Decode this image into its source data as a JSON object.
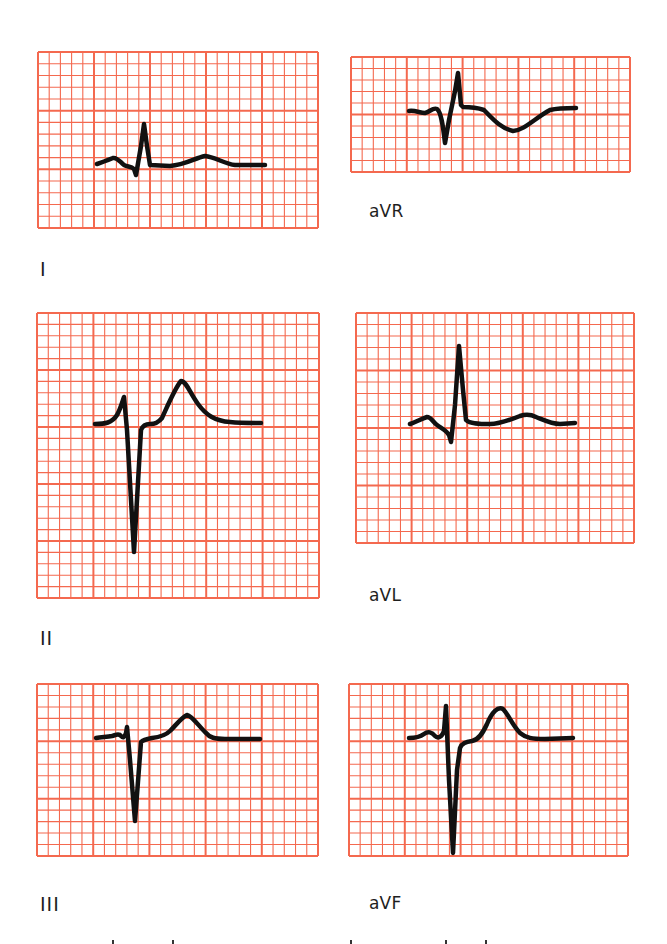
{
  "figure": {
    "grid_color": "#f4694f",
    "trace_color": "#111111",
    "label_color": "#1e1e1e",
    "small_squares_per_large": 5
  },
  "leads": [
    {
      "id": "I",
      "label": "I",
      "panel": {
        "x": 38,
        "y": 52,
        "w": 280,
        "h": 176,
        "cols": 5,
        "rows": 3
      },
      "label_pos": {
        "x": 40,
        "y": 258
      },
      "trace": "M97,164 C103,162 108,160 113,158 C117,157 120,162 124,165 C128,167 131,166 134,169 L136,175 L141,146 L144,124 L147,146 L150,165 L170,166 C185,165 195,158 205,156 C215,157 225,164 235,165 L265,165",
      "thick_from": 0
    },
    {
      "id": "aVR",
      "label": "aVR",
      "panel": {
        "x": 351,
        "y": 57,
        "w": 279,
        "h": 115,
        "cols": 5,
        "rows": 2
      },
      "label_pos": {
        "x": 369,
        "y": 201
      },
      "trace": "M409,111 C415,110 420,113 425,113 C430,112 433,107 437,109 C441,112 443,125 445,143 L449,120 L455,91 L458,73 L461,105 L463,107 C470,107 478,108 484,110 C492,118 500,128 513,131 C525,130 535,118 550,110 C558,108 568,108 576,108",
      "thick_from": 0
    },
    {
      "id": "II",
      "label": "II",
      "panel": {
        "x": 37,
        "y": 313,
        "w": 282,
        "h": 285,
        "cols": 5,
        "rows": 5
      },
      "label_pos": {
        "x": 40,
        "y": 627
      },
      "trace": "M95,424 C105,424 112,423 117,415 C120,410 122,403 124,397 L127,430 L134,552 L141,430 C143,425 146,424 150,424 C155,424 158,423 162,418 C168,405 175,388 181,381 C186,381 190,393 198,404 C206,415 215,421 230,422 C240,423 250,423 261,423",
      "thick_from": 0
    },
    {
      "id": "aVL",
      "label": "aVL",
      "panel": {
        "x": 356,
        "y": 313,
        "w": 278,
        "h": 230,
        "cols": 5,
        "rows": 4
      },
      "label_pos": {
        "x": 369,
        "y": 585
      },
      "trace": "M410,424 C416,422 421,419 427,417 C431,417 433,422 437,425 C441,428 446,430 449,435 L451,442 L455,405 L459,346 L463,390 L466,420 C470,424 480,424 490,424 C500,424 510,420 520,416 C526,414 530,414 536,417 C546,421 552,424 560,424 L575,423",
      "thick_from": 0
    },
    {
      "id": "III",
      "label": "III",
      "panel": {
        "x": 37,
        "y": 684,
        "w": 281,
        "h": 172,
        "cols": 5,
        "rows": 3
      },
      "label_pos": {
        "x": 40,
        "y": 893
      },
      "trace": "M96,738 C102,737 107,737 112,736 C116,735 119,733 121,736 C123,738 124,738 126,733 L127,727 L130,760 L135,821 L141,742 C143,740 147,739 152,738 C160,737 166,735 170,731 C176,725 181,718 187,715 C192,716 198,725 205,732 C210,738 215,739 225,739 L260,739",
      "thick_from": 0
    },
    {
      "id": "aVF",
      "label": "aVF",
      "panel": {
        "x": 349,
        "y": 684,
        "w": 279,
        "h": 172,
        "cols": 5,
        "rows": 3
      },
      "label_pos": {
        "x": 369,
        "y": 893
      },
      "trace": "M409,738 C415,738 420,737 424,734 C428,731 432,732 435,736 C438,739 442,737 444,731 L446,706 L449,780 L453,853 L457,770 L460,748 C462,743 466,742 472,741 C478,740 482,735 487,724 C492,712 498,706 503,709 C508,714 513,726 520,733 C526,738 532,739 545,739 L573,738",
      "thick_from": 0
    }
  ],
  "cropped_text_fragments": [
    112,
    172,
    350,
    445,
    485
  ]
}
